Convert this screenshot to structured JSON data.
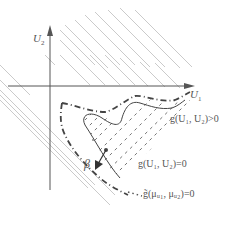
{
  "diagram": {
    "axes": {
      "x_label": "U",
      "x_sub": "1",
      "y_label": "U",
      "y_sub": "2"
    },
    "labels": {
      "safe_region": "g(U₁, U₂)>0",
      "limit_state": "g(U₁, U₂)=0",
      "approx_limit_state": "g̃(μᵤ₁, μᵤ₂)=0",
      "reliability_index": "β"
    },
    "colors": {
      "axis": "#555555",
      "hatch": "#bbbbbb",
      "curve": "#444444",
      "text": "#555555"
    }
  }
}
